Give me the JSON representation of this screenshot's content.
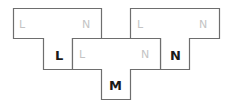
{
  "diagram": {
    "type": "tile-puzzle",
    "pieces": [
      {
        "id": "top-left",
        "labels": [
          {
            "text": "L",
            "style": "faint",
            "position": "top-left"
          },
          {
            "text": "N",
            "style": "faint",
            "position": "top-right"
          },
          {
            "text": "L",
            "style": "bold",
            "position": "stem"
          }
        ]
      },
      {
        "id": "middle",
        "labels": [
          {
            "text": "L",
            "style": "faint",
            "position": "top-left"
          },
          {
            "text": "N",
            "style": "faint",
            "position": "top-right"
          },
          {
            "text": "M",
            "style": "bold",
            "position": "stem"
          }
        ]
      },
      {
        "id": "top-right",
        "labels": [
          {
            "text": "L",
            "style": "faint",
            "position": "top-left"
          },
          {
            "text": "N",
            "style": "faint",
            "position": "top-right"
          },
          {
            "text": "N",
            "style": "bold",
            "position": "stem"
          }
        ]
      }
    ],
    "colors": {
      "border": "#6e6e6e",
      "faint_text": "#c4c4c4",
      "bold_text": "#1a1a1a"
    }
  }
}
